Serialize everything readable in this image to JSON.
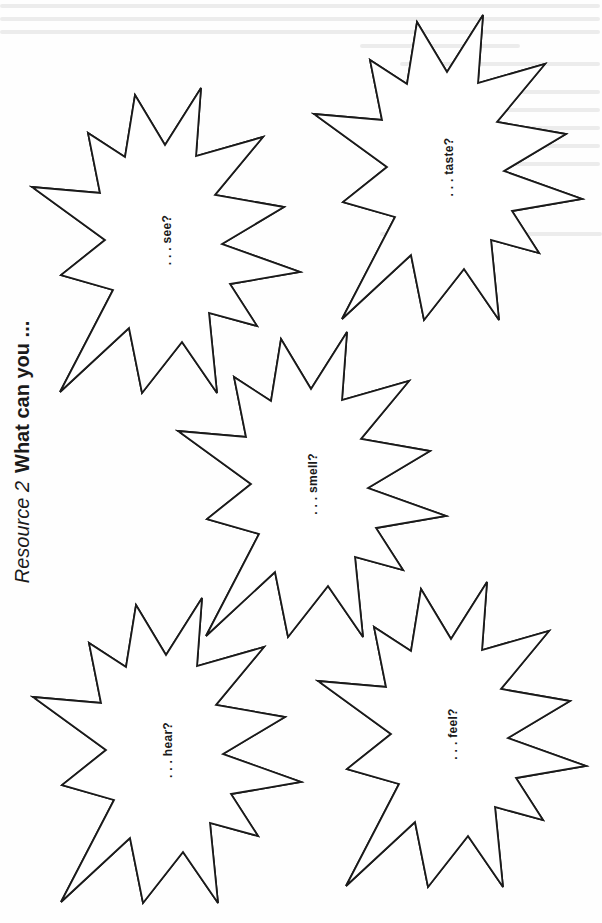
{
  "document": {
    "title": {
      "resource": "Resource 2",
      "question": "What can you ..."
    },
    "orientation": "rotated -90deg (landscape printed on portrait page)",
    "colors": {
      "ink": "#1a1a1a",
      "paper": "#ffffff",
      "bleed_through": "#ececec"
    },
    "bursts": [
      {
        "id": "see",
        "label": ". . . see?",
        "center": [
          167,
          240
        ]
      },
      {
        "id": "taste",
        "label": ". . . taste?",
        "center": [
          449,
          167
        ]
      },
      {
        "id": "smell",
        "label": ". . . smell?",
        "center": [
          313,
          484
        ]
      },
      {
        "id": "hear",
        "label": ". . . hear?",
        "center": [
          168,
          750
        ]
      },
      {
        "id": "feel",
        "label": ". . . feel?",
        "center": [
          453,
          734
        ]
      }
    ]
  }
}
